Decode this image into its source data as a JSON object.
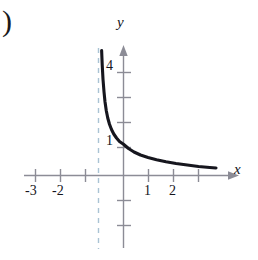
{
  "figure": {
    "part_label": ")",
    "axes": {
      "x_label": "x",
      "y_label": "y",
      "x_ticks_labeled": [
        "-3",
        "-2",
        "1",
        "2"
      ],
      "y_ticks_labeled": [
        "1",
        "4"
      ]
    },
    "colors": {
      "curve": "#16161e",
      "axis": "#8c8c96",
      "asymptote": "#a9c3d4",
      "text": "#15151c"
    }
  },
  "chart_data": {
    "type": "line",
    "title": "",
    "xlabel": "x",
    "ylabel": "y",
    "xlim": [
      -3.9,
      4.6
    ],
    "ylim": [
      -2.9,
      5.1
    ],
    "grid": false,
    "legend": null,
    "x_ticks": [
      -3,
      -2,
      -1,
      1,
      2,
      3
    ],
    "x_tick_labels": [
      "-3",
      "-2",
      "",
      "1",
      "2",
      ""
    ],
    "y_ticks": [
      1,
      2,
      3,
      4
    ],
    "y_tick_labels": [
      "1",
      "",
      "",
      "4"
    ],
    "annotations": [
      {
        "type": "vertical-asymptote",
        "x": -1,
        "style": "dashed",
        "color": "#a9c3d4"
      }
    ],
    "series": [
      {
        "name": "curve",
        "x": [
          -0.875,
          -0.85,
          -0.82,
          -0.78,
          -0.74,
          -0.69,
          -0.63,
          -0.56,
          -0.48,
          -0.39,
          -0.28,
          -0.16,
          0.0,
          0.2,
          0.42,
          0.68,
          0.98,
          1.32,
          1.7,
          2.1,
          2.55,
          3.0,
          3.45,
          3.7
        ],
        "y": [
          5.0,
          4.4,
          3.85,
          3.35,
          2.95,
          2.6,
          2.3,
          2.05,
          1.84,
          1.66,
          1.5,
          1.36,
          1.25,
          1.08,
          0.94,
          0.82,
          0.72,
          0.63,
          0.55,
          0.48,
          0.42,
          0.36,
          0.32,
          0.3
        ]
      }
    ]
  }
}
